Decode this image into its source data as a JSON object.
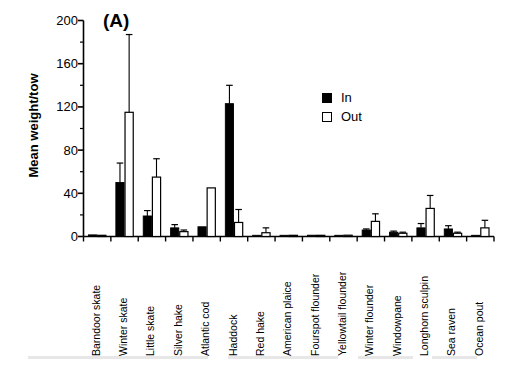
{
  "figure": {
    "panel_letter": "(A)",
    "ylabel": "Mean weight/tow"
  },
  "legend": {
    "items": [
      {
        "label": "In",
        "swatch": "filled-square-icon",
        "color": "#000000"
      },
      {
        "label": "Out",
        "swatch": "open-square-icon",
        "color": "#ffffff"
      }
    ]
  },
  "yaxis": {
    "ticks": [
      "0",
      "40",
      "80",
      "120",
      "160",
      "200"
    ]
  },
  "chart_data": {
    "type": "bar",
    "title": "(A)",
    "xlabel": "",
    "ylabel": "Mean weight/tow",
    "ylim": [
      0,
      200
    ],
    "ytick_values": [
      0,
      40,
      80,
      120,
      160,
      200
    ],
    "minor_tick_interval": 20,
    "grid": false,
    "legend_position": "upper-right-inside",
    "error_bars": "upper-only",
    "categories": [
      "Barndoor skate",
      "Winter skate",
      "Little skate",
      "Silver hake",
      "Atlantic cod",
      "Haddock",
      "Red hake",
      "American plaice",
      "Fourspot flounder",
      "Yellowtail flounder",
      "Winter flounder",
      "Windowpane",
      "Longhorn sculpin",
      "Sea raven",
      "Ocean pout"
    ],
    "series": [
      {
        "name": "In",
        "color": "#000000",
        "values": [
          1.5,
          50,
          19,
          8,
          9,
          123,
          0.8,
          1.0,
          1.2,
          0.8,
          6,
          4,
          8,
          7,
          1
        ],
        "err_top": [
          2.0,
          68,
          24,
          11,
          9,
          140,
          1.2,
          1.4,
          1.6,
          1.2,
          7,
          5,
          12,
          10,
          1
        ]
      },
      {
        "name": "Out",
        "color": "#ffffff",
        "values": [
          1.0,
          115,
          55,
          4.5,
          45,
          13,
          3.5,
          0.6,
          1.0,
          1.2,
          14,
          3,
          26,
          3,
          8
        ],
        "err_top": [
          1.2,
          187,
          72,
          6,
          45,
          25,
          8,
          0.8,
          1.4,
          1.6,
          21,
          4,
          38,
          4,
          15
        ]
      }
    ]
  }
}
